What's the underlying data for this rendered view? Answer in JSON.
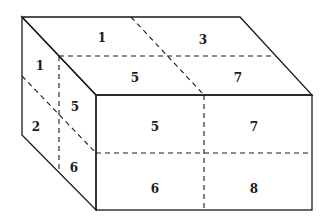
{
  "figure": {
    "faces": {
      "top": {
        "labels": [
          {
            "id": "top-back-left",
            "text": "1",
            "x": 102,
            "y": 38
          },
          {
            "id": "top-back-right",
            "text": "3",
            "x": 203,
            "y": 40
          },
          {
            "id": "top-front-left",
            "text": "5",
            "x": 135,
            "y": 78
          },
          {
            "id": "top-front-right",
            "text": "7",
            "x": 238,
            "y": 78
          }
        ]
      },
      "left": {
        "labels": [
          {
            "id": "left-top-back",
            "text": "1",
            "x": 40,
            "y": 66
          },
          {
            "id": "left-top-front",
            "text": "5",
            "x": 75,
            "y": 107
          },
          {
            "id": "left-bottom-back",
            "text": "2",
            "x": 36,
            "y": 127
          },
          {
            "id": "left-bottom-front",
            "text": "6",
            "x": 74,
            "y": 168
          }
        ]
      },
      "front": {
        "labels": [
          {
            "id": "front-top-left",
            "text": "5",
            "x": 155,
            "y": 127
          },
          {
            "id": "front-top-right",
            "text": "7",
            "x": 254,
            "y": 127
          },
          {
            "id": "front-bottom-left",
            "text": "6",
            "x": 155,
            "y": 189
          },
          {
            "id": "front-bottom-right",
            "text": "8",
            "x": 254,
            "y": 189
          }
        ]
      }
    },
    "colors": {
      "line": "#1a1a1a",
      "background": "#ffffff"
    }
  }
}
